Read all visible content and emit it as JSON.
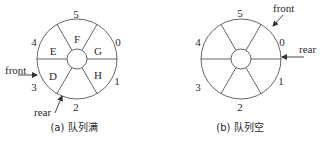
{
  "diagram": {
    "panels": [
      {
        "id": "a",
        "caption": "(a) 队列满",
        "indices": [
          "0",
          "1",
          "2",
          "3",
          "4",
          "5"
        ],
        "cells": {
          "0": "G",
          "1": "H",
          "2": "",
          "3": "D",
          "4": "E",
          "5": "F"
        },
        "pointers": {
          "front": "front",
          "rear": "rear"
        },
        "front_at": "3",
        "rear_at": "2"
      },
      {
        "id": "b",
        "caption": "(b) 队列空",
        "indices": [
          "0",
          "1",
          "2",
          "3",
          "4",
          "5"
        ],
        "cells": {
          "0": "",
          "1": "",
          "2": "",
          "3": "",
          "4": "",
          "5": ""
        },
        "pointers": {
          "front": "front",
          "rear": "rear"
        },
        "front_at": "0",
        "rear_at": "0"
      }
    ]
  },
  "colors": {
    "line": "#555555",
    "text": "#2a2a2a",
    "background": "#ffffff"
  }
}
